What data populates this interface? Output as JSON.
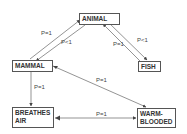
{
  "nodes": {
    "animal": "ANIMAL",
    "mammal": "MAMMAL",
    "fish": "FISH",
    "breathes_air_line1": "BREATHES",
    "breathes_air_line2": "AIR",
    "warm_blooded_line1": "WARM-",
    "warm_blooded_line2": "BLOODED"
  },
  "edges": {
    "mammal_to_animal": "P=1",
    "animal_to_mammal": "P<1",
    "fish_to_animal": "P=1",
    "animal_to_fish": "P<1",
    "mammal_breathes_air": "P=1",
    "mammal_warm_blooded": "P=1",
    "breathes_air_warm_blooded": "P=1"
  },
  "colors": {
    "line": "#555555",
    "text": "#333333"
  }
}
